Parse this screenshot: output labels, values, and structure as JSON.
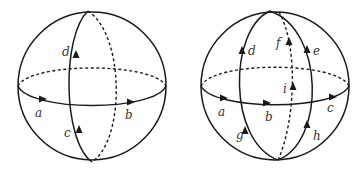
{
  "figure": {
    "left_sphere": {
      "labels": {
        "a": "a",
        "b": "b",
        "c": "c",
        "d": "d"
      }
    },
    "right_sphere": {
      "labels": {
        "a": "a",
        "b": "b",
        "c": "c",
        "d": "d",
        "e": "e",
        "f": "f",
        "g": "g",
        "h": "h",
        "i": "i"
      }
    },
    "colors": {
      "stroke": "#1a1a1a",
      "label": "#333333",
      "background": "#ffffff"
    }
  }
}
